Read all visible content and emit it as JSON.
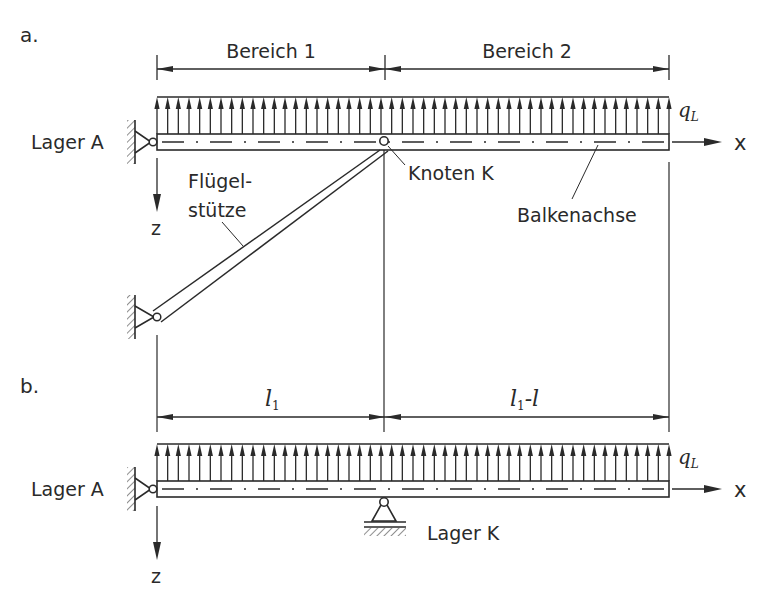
{
  "figure": {
    "panels": [
      {
        "id": "a",
        "label": "a.",
        "dimension_labels": [
          "Bereich 1",
          "Bereich 2"
        ],
        "support_left_label": "Lager A",
        "load_label": "q",
        "load_subscript": "L",
        "x_axis_label": "x",
        "z_axis_label": "z",
        "node_label": "Knoten K",
        "strut_label_line1": "Flügel-",
        "strut_label_line2": "stütze",
        "beam_axis_label": "Balkenachse"
      },
      {
        "id": "b",
        "label": "b.",
        "dim1_main": "l",
        "dim1_sub": "1",
        "dim2_main": "l",
        "dim2_sub": "1",
        "dim2_tail": "-l",
        "support_left_label": "Lager A",
        "support_mid_label": "Lager K",
        "load_label": "q",
        "load_subscript": "L",
        "x_axis_label": "x",
        "z_axis_label": "z"
      }
    ],
    "colors": {
      "line": "#2a2a2a",
      "background": "#ffffff"
    }
  }
}
